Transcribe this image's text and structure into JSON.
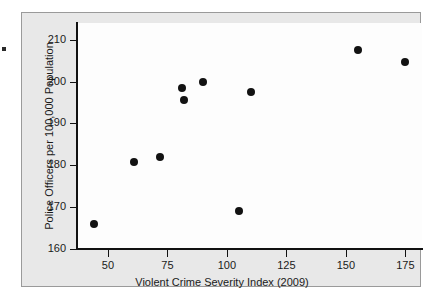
{
  "chart_data": {
    "type": "scatter",
    "title": "",
    "xlabel": "Violent Crime Severity Index (2009)",
    "ylabel": "Police Officers per 100,000 Population",
    "xlim": [
      37,
      182
    ],
    "ylim": [
      160,
      214
    ],
    "xticks": [
      50,
      75,
      100,
      125,
      150,
      175
    ],
    "yticks": [
      160,
      170,
      180,
      190,
      200,
      210
    ],
    "xtick_labels": [
      "50",
      "75",
      "100",
      "125",
      "150",
      "175"
    ],
    "ytick_labels": [
      "160",
      "170",
      "180",
      "190",
      "200",
      "210"
    ],
    "grid": false,
    "legend": null,
    "marker": {
      "shape": "circle",
      "color": "#121212",
      "size": 8
    },
    "points": [
      {
        "x": 44,
        "y": 166.0
      },
      {
        "x": 61,
        "y": 180.7
      },
      {
        "x": 72,
        "y": 182.1
      },
      {
        "x": 81,
        "y": 198.5
      },
      {
        "x": 82,
        "y": 195.5
      },
      {
        "x": 90,
        "y": 199.8
      },
      {
        "x": 105,
        "y": 169.1
      },
      {
        "x": 110,
        "y": 197.5
      },
      {
        "x": 155,
        "y": 207.5
      },
      {
        "x": 175,
        "y": 204.6
      }
    ]
  },
  "colors": {
    "figure_background": "#e8e8e8",
    "plot_background": "#fdfdfd",
    "axis": "#111111",
    "text": "#1a1a1a",
    "marker": "#121212"
  }
}
